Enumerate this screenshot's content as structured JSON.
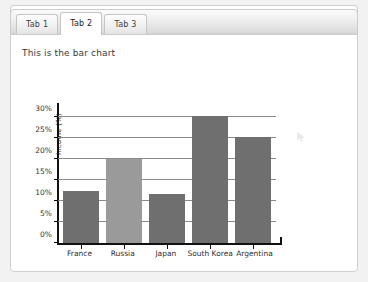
{
  "window": {
    "background_color": "#f2f2f2",
    "panel_background": "#ffffff",
    "panel_border_color": "#cfcfcf"
  },
  "tabs": {
    "active_index": 1,
    "items": [
      {
        "label": "Tab 1"
      },
      {
        "label": "Tab 2"
      },
      {
        "label": "Tab 3"
      }
    ]
  },
  "content": {
    "heading": "This is the bar chart"
  },
  "chart_data": {
    "type": "bar",
    "title": "",
    "xlabel": "",
    "ylabel": "Income (%)",
    "categories": [
      "France",
      "Russia",
      "Japan",
      "South Korea",
      "Argentina"
    ],
    "values": [
      12.5,
      20.0,
      11.7,
      30.3,
      25.3
    ],
    "series": [
      {
        "name": "Income (%)",
        "values": [
          12.5,
          20.0,
          11.7,
          30.3,
          25.3
        ]
      }
    ],
    "bar_colors": [
      "#6f6f6f",
      "#9a9a9a",
      "#6f6f6f",
      "#6f6f6f",
      "#6f6f6f"
    ],
    "ylim": [
      0,
      31.5
    ],
    "yticks": [
      0,
      5,
      10,
      15,
      20,
      25,
      30
    ],
    "ytick_labels": [
      "0%",
      "5%",
      "10%",
      "15%",
      "20%",
      "25%",
      "30%"
    ],
    "gridlines": [
      5,
      10,
      15,
      20,
      25,
      30
    ],
    "grid": true,
    "grid_color": "#8a8a8a",
    "axis_color": "#111111",
    "legend": null,
    "legend_position": "none"
  }
}
